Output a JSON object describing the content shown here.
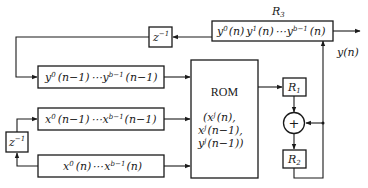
{
  "diagram": {
    "type": "block-diagram",
    "blocks": {
      "r3": {
        "name": "R3",
        "label_main": "R",
        "label_sub": "3",
        "content": "y⁰(n) y¹(n) ⋯ y^(b−1)(n)",
        "parts": {
          "a": "y",
          "a_sup": "0",
          "a_arg": "(n)",
          "b": "y",
          "b_sup": "1",
          "b_arg": "(n)",
          "dots": "⋯",
          "c": "y",
          "c_sup": "b−1",
          "c_arg": "(n)"
        }
      },
      "z_top": {
        "name": "z^-1",
        "base": "z",
        "exp": "−1"
      },
      "y_prev": {
        "content": "y⁰(n−1) ⋯ y^(b−1)(n−1)",
        "parts": {
          "a": "y",
          "a_sup": "0",
          "a_arg": "(n−1)",
          "dots": "⋯",
          "c": "y",
          "c_sup": "b−1",
          "c_arg": "(n−1)"
        }
      },
      "x_prev": {
        "content": "x⁰(n−1) ⋯ x^(b−1)(n−1)",
        "parts": {
          "a": "x",
          "a_sup": "0",
          "a_arg": "(n−1)",
          "dots": "⋯",
          "c": "x",
          "c_sup": "b−1",
          "c_arg": "(n−1)"
        }
      },
      "x_cur": {
        "content": "x⁰(n) ⋯ x^(b−1)(n)",
        "parts": {
          "a": "x",
          "a_sup": "0",
          "a_arg": "(n)",
          "dots": "⋯",
          "c": "x",
          "c_sup": "b−1",
          "c_arg": "(n)"
        }
      },
      "z_left": {
        "name": "z^-1",
        "base": "z",
        "exp": "−1"
      },
      "rom": {
        "title": "ROM",
        "line1": "(x",
        "line1_sup": "j",
        "line1_arg": "(n),",
        "line2": "x",
        "line2_sup": "j",
        "line2_arg": "(n−1),",
        "line3": "y",
        "line3_sup": "j",
        "line3_arg": "(n−1))"
      },
      "r1": {
        "label_main": "R",
        "label_sub": "1"
      },
      "adder": {
        "symbol": "+"
      },
      "r2": {
        "label_main": "R",
        "label_sub": "2"
      }
    },
    "output": {
      "label": "y(n)",
      "base": "y",
      "arg": "(n)"
    },
    "connections": [
      "R3 → z^-1 (top)",
      "z^-1 (top) → y_prev register",
      "y_prev register → ROM",
      "x_cur register → z^-1 (left)",
      "z^-1 (left) → x_prev register",
      "x_prev register → ROM",
      "x_cur register → ROM",
      "ROM → R1",
      "R1 → adder",
      "adder → R2",
      "R2 → adder (feedback)",
      "R2 → R3 (feedback)",
      "R3 → y(n)"
    ]
  }
}
